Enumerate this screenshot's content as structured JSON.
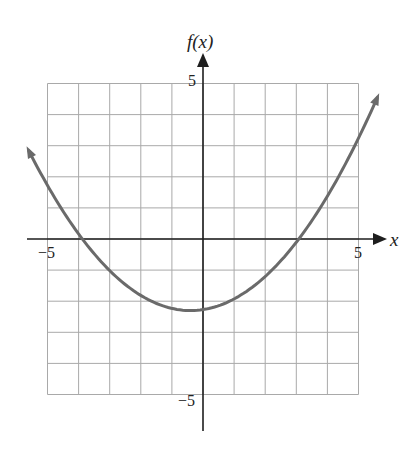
{
  "chart_data": {
    "type": "line",
    "title": "",
    "xlabel": "x",
    "ylabel": "f(x)",
    "xlim": [
      -5,
      5
    ],
    "ylim": [
      -5,
      5
    ],
    "grid": true,
    "grid_step": 1,
    "tick_labels": {
      "x": [
        {
          "value": -5,
          "label": "−5"
        },
        {
          "value": 5,
          "label": "5"
        }
      ],
      "y": [
        {
          "value": 5,
          "label": "5"
        },
        {
          "value": -5,
          "label": "−5"
        }
      ]
    },
    "series": [
      {
        "name": "f(x)",
        "description": "upward-opening parabola with arrows at both ends",
        "approx_equation": "f(x) = 0.19(x + 0.4)^2 - 2.3",
        "vertex": [
          -0.4,
          -2.3
        ],
        "x_intercepts": [
          -3.9,
          3.1
        ],
        "y_intercept": -2.27,
        "endpoints": [
          [
            -5.6,
            2.9
          ],
          [
            5.6,
            4.4
          ]
        ],
        "points": [
          [
            -5.6,
            2.9
          ],
          [
            -5,
            2.6
          ],
          [
            -4,
            0.2
          ],
          [
            -3.9,
            0
          ],
          [
            -3,
            -1.0
          ],
          [
            -2,
            -1.8
          ],
          [
            -1,
            -2.2
          ],
          [
            -0.4,
            -2.3
          ],
          [
            0,
            -2.27
          ],
          [
            1,
            -1.9
          ],
          [
            2,
            -1.2
          ],
          [
            3,
            -0.2
          ],
          [
            3.1,
            0
          ],
          [
            4,
            1.4
          ],
          [
            5,
            3.2
          ],
          [
            5.6,
            4.4
          ]
        ],
        "color": "#6a6a6a"
      }
    ]
  },
  "labels": {
    "y_axis": "f(x)",
    "x_axis": "x",
    "x_min": "−5",
    "x_max": "5",
    "y_max": "5",
    "y_min": "−5"
  },
  "colors": {
    "grid": "#a9a9a9",
    "axis": "#1e1e1e",
    "curve": "#6a6a6a"
  }
}
